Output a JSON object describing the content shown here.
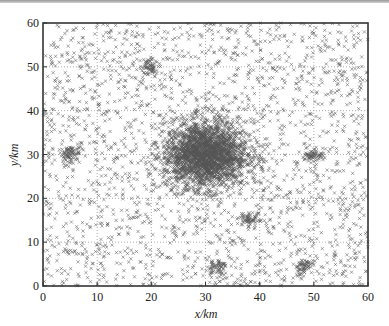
{
  "chart_data": {
    "type": "scatter",
    "title": "",
    "xlabel": "x/km",
    "ylabel": "y/km",
    "xlim": [
      0,
      60
    ],
    "ylim": [
      0,
      60
    ],
    "xticks": [
      0,
      10,
      20,
      30,
      40,
      50,
      60
    ],
    "yticks": [
      0,
      10,
      20,
      30,
      40,
      50,
      60
    ],
    "grid": "dotted",
    "marker": "x",
    "marker_color": "#555555",
    "legend": null,
    "series": [
      {
        "name": "background",
        "distribution": "uniform",
        "count": 2200,
        "x_range": [
          0,
          60
        ],
        "y_range": [
          0,
          60
        ]
      },
      {
        "name": "cluster-main",
        "center": [
          30,
          30
        ],
        "sigma": 3.8,
        "count": 2600
      },
      {
        "name": "cluster-1",
        "center": [
          5,
          30
        ],
        "sigma": 0.9,
        "count": 70
      },
      {
        "name": "cluster-2",
        "center": [
          20,
          50
        ],
        "sigma": 0.9,
        "count": 60
      },
      {
        "name": "cluster-3",
        "center": [
          50,
          30
        ],
        "sigma": 0.9,
        "count": 60
      },
      {
        "name": "cluster-4",
        "center": [
          38,
          15
        ],
        "sigma": 0.9,
        "count": 60
      },
      {
        "name": "cluster-5",
        "center": [
          32,
          4.5
        ],
        "sigma": 0.9,
        "count": 60
      },
      {
        "name": "cluster-6",
        "center": [
          48,
          4.5
        ],
        "sigma": 0.9,
        "count": 60
      }
    ]
  },
  "axes": {
    "x_label": "x/km",
    "y_label": "y/km",
    "x_tick_labels": [
      "0",
      "10",
      "20",
      "30",
      "40",
      "50",
      "60"
    ],
    "y_tick_labels": [
      "0",
      "10",
      "20",
      "30",
      "40",
      "50",
      "60"
    ]
  }
}
